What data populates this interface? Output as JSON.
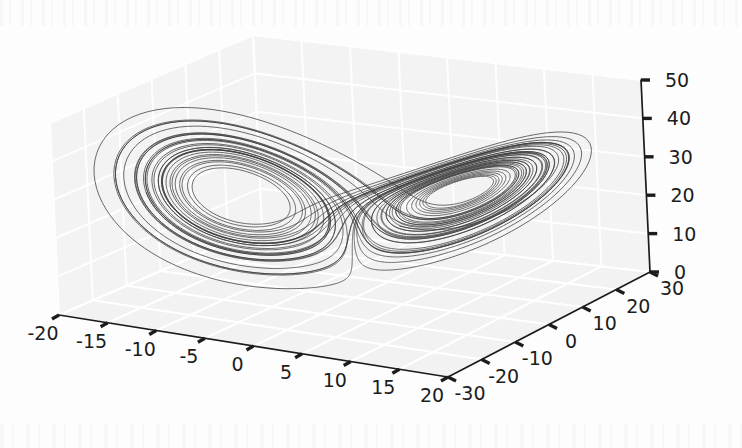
{
  "figure": {
    "kind": "matplotlib-3d-axes",
    "background_color": "#fdfdfd",
    "pane_color": "#f2f2f2",
    "pane_edge_color": "#e3e3e3",
    "grid_color": "#ffffff",
    "axis_line_color": "#1c1c1c",
    "tick_color": "#1c1c1c",
    "line_color": "#3c3c3c",
    "tick_label_color": "#1c1c1c"
  },
  "chart_data": {
    "type": "line",
    "title": "",
    "subtitle": "",
    "projection": "3d",
    "system": "Lorenz attractor",
    "xlabel": "",
    "ylabel": "",
    "zlabel": "",
    "grid": true,
    "legend": "none",
    "annotations": [],
    "xlim": [
      -20,
      20
    ],
    "ylim": [
      -30,
      30
    ],
    "zlim": [
      0,
      50
    ],
    "xticks": [
      "-20",
      "-15",
      "-10",
      "-5",
      "0",
      "5",
      "10",
      "15",
      "20"
    ],
    "xtick_values": [
      -20,
      -15,
      -10,
      -5,
      0,
      5,
      10,
      15,
      20
    ],
    "yticks": [
      "-30",
      "-20",
      "-10",
      "0",
      "10",
      "20",
      "30"
    ],
    "ytick_values": [
      -30,
      -20,
      -10,
      0,
      10,
      20,
      30
    ],
    "zticks": [
      "0",
      "10",
      "20",
      "30",
      "40",
      "50"
    ],
    "ztick_values": [
      0,
      10,
      20,
      30,
      40,
      50
    ],
    "series": [
      {
        "name": "lorenz-trajectory",
        "color": "#3c3c3c",
        "linewidth": 0.85,
        "generator": "lorenz",
        "params": {
          "sigma": 10.0,
          "rho": 28.0,
          "beta": 2.6666666667
        },
        "initial_state": [
          0.2,
          12.0,
          14.0
        ],
        "dt": 0.0045,
        "steps": 11000
      }
    ],
    "view": {
      "elev": 26,
      "azim": -60
    }
  },
  "ticklabels": {
    "x": [
      "-20",
      "-15",
      "-10",
      "-5",
      "0",
      "5",
      "10",
      "15",
      "20"
    ],
    "y": [
      "-30",
      "-20",
      "-10",
      "0",
      "10",
      "20",
      "30"
    ],
    "z": [
      "0",
      "10",
      "20",
      "30",
      "40",
      "50"
    ]
  }
}
